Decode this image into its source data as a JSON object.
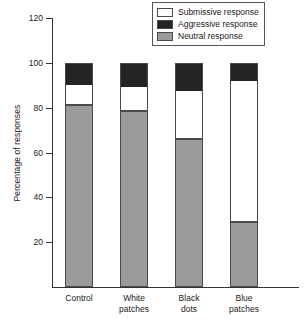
{
  "chart_data": {
    "type": "bar",
    "stacked": true,
    "title": "",
    "xlabel": "",
    "ylabel": "Percentage of responses",
    "ylim": [
      0,
      120
    ],
    "yticks": [
      20,
      40,
      60,
      80,
      100,
      120
    ],
    "ytick_labels": [
      "20",
      "40",
      "60",
      "80",
      "100",
      "120"
    ],
    "grid": false,
    "legend_position": "top-right",
    "categories": [
      "Control",
      "White patches",
      "Black dots",
      "Blue patches"
    ],
    "category_lines": [
      [
        "Control",
        ""
      ],
      [
        "White",
        "patches"
      ],
      [
        "Black",
        "dots"
      ],
      [
        "Blue",
        "patches"
      ]
    ],
    "series": [
      {
        "name": "Neutral response",
        "color": "#9a9a9a",
        "values": [
          81.5,
          79.0,
          66.0,
          29.0
        ]
      },
      {
        "name": "Submissive response",
        "color": "#ffffff",
        "values": [
          9.0,
          10.5,
          22.0,
          63.5
        ]
      },
      {
        "name": "Aggressive response",
        "color": "#242424",
        "values": [
          9.5,
          10.5,
          12.0,
          7.5
        ]
      }
    ],
    "cumulative_tops": [
      {
        "category": "Control",
        "neutral_top": 81.5,
        "submissive_top": 90.5,
        "aggressive_top": 100
      },
      {
        "category": "White patches",
        "neutral_top": 79.0,
        "submissive_top": 89.5,
        "aggressive_top": 100
      },
      {
        "category": "Black dots",
        "neutral_top": 66.0,
        "submissive_top": 88.0,
        "aggressive_top": 100
      },
      {
        "category": "Blue patches",
        "neutral_top": 29.0,
        "submissive_top": 92.5,
        "aggressive_top": 100
      }
    ]
  },
  "legend": {
    "items": [
      {
        "label": "Submissive response",
        "swatch": "white"
      },
      {
        "label": "Aggressive response",
        "swatch": "black"
      },
      {
        "label": "Neutral response",
        "swatch": "gray"
      }
    ]
  },
  "axes": {
    "y_title": "Percentage of responses",
    "y_ticks": [
      "120",
      "100",
      "80",
      "60",
      "40",
      "20"
    ]
  },
  "colors": {
    "neutral": "#9a9a9a",
    "aggressive": "#242424",
    "submissive": "#ffffff",
    "axis": "#333333",
    "outline": "#4a4a4a",
    "background": "#ffffff"
  }
}
